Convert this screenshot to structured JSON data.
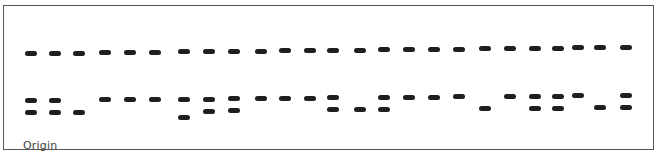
{
  "diagram": {
    "type": "gel-electrophoresis",
    "origin_label": "Origin",
    "lane_count": 25,
    "band_color": "#1f1f1f",
    "border_color": "#555555",
    "lanes": [
      {
        "lane": 1,
        "x": 31,
        "bands": [
          "top",
          "upper",
          "lower"
        ]
      },
      {
        "lane": 2,
        "x": 55,
        "bands": [
          "top",
          "upper",
          "lower"
        ]
      },
      {
        "lane": 3,
        "x": 79,
        "bands": [
          "top",
          "lower"
        ]
      },
      {
        "lane": 4,
        "x": 105,
        "bands": [
          "top",
          "upper"
        ]
      },
      {
        "lane": 5,
        "x": 130,
        "bands": [
          "top",
          "upper"
        ]
      },
      {
        "lane": 6,
        "x": 155,
        "bands": [
          "top",
          "upper"
        ]
      },
      {
        "lane": 7,
        "x": 184,
        "bands": [
          "top",
          "upper",
          "lowest"
        ]
      },
      {
        "lane": 8,
        "x": 209,
        "bands": [
          "top",
          "upper",
          "lower"
        ]
      },
      {
        "lane": 9,
        "x": 234,
        "bands": [
          "top",
          "upper",
          "lower"
        ]
      },
      {
        "lane": 10,
        "x": 261,
        "bands": [
          "top",
          "upper"
        ]
      },
      {
        "lane": 11,
        "x": 285,
        "bands": [
          "top",
          "upper"
        ]
      },
      {
        "lane": 12,
        "x": 310,
        "bands": [
          "top",
          "upper"
        ]
      },
      {
        "lane": 13,
        "x": 333,
        "bands": [
          "top",
          "upper",
          "lower"
        ]
      },
      {
        "lane": 14,
        "x": 360,
        "bands": [
          "top",
          "lower"
        ]
      },
      {
        "lane": 15,
        "x": 384,
        "bands": [
          "top",
          "upper",
          "lower"
        ]
      },
      {
        "lane": 16,
        "x": 409,
        "bands": [
          "top",
          "upper"
        ]
      },
      {
        "lane": 17,
        "x": 434,
        "bands": [
          "top",
          "upper"
        ]
      },
      {
        "lane": 18,
        "x": 459,
        "bands": [
          "top",
          "upper"
        ]
      },
      {
        "lane": 19,
        "x": 485,
        "bands": [
          "top",
          "lower"
        ]
      },
      {
        "lane": 20,
        "x": 510,
        "bands": [
          "top",
          "upper"
        ]
      },
      {
        "lane": 21,
        "x": 535,
        "bands": [
          "top",
          "upper",
          "lower"
        ]
      },
      {
        "lane": 22,
        "x": 558,
        "bands": [
          "top",
          "upper",
          "lower"
        ]
      },
      {
        "lane": 23,
        "x": 578,
        "bands": [
          "top",
          "upper"
        ]
      },
      {
        "lane": 24,
        "x": 600,
        "bands": [
          "top",
          "lower"
        ]
      },
      {
        "lane": 25,
        "x": 626,
        "bands": [
          "top",
          "upper",
          "lower"
        ]
      }
    ],
    "band_rows": {
      "top": {
        "y_left": 51,
        "y_right": 45
      },
      "upper": {
        "y_left": 98,
        "y_right": 93
      },
      "lower": {
        "y_left": 110,
        "y_right": 105
      },
      "lowest": {
        "y_left": 116,
        "y_right": 111
      }
    }
  }
}
